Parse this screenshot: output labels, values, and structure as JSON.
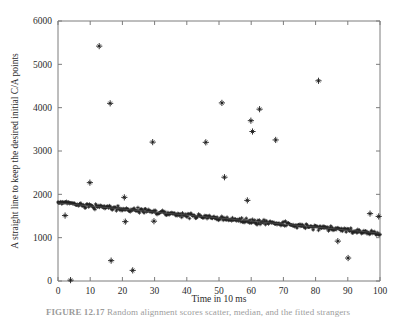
{
  "figure": {
    "caption_label": "FIGURE 12.17",
    "caption_text": "Random alignment scores scatter, median, and the fitted strangers"
  },
  "chart_data": {
    "type": "scatter",
    "title": "",
    "xlabel": "Time  in 10 ms",
    "ylabel": "A straight line to keep the desired initial C/A points",
    "xlim": [
      0,
      100
    ],
    "ylim": [
      0,
      6000
    ],
    "xticks": [
      0,
      10,
      20,
      30,
      40,
      50,
      60,
      70,
      80,
      90,
      100
    ],
    "yticks": [
      0,
      1000,
      2000,
      3000,
      4000,
      5000,
      6000
    ],
    "grid": false,
    "legend": "none",
    "marker": "plus-star",
    "marker_color": "#1a1a1a",
    "series": [
      {
        "name": "outliers",
        "points": [
          [
            2.2,
            1510
          ],
          [
            3.9,
            20
          ],
          [
            9.9,
            2270
          ],
          [
            12.8,
            5420
          ],
          [
            16.2,
            4100
          ],
          [
            16.5,
            470
          ],
          [
            20.6,
            1930
          ],
          [
            20.9,
            1370
          ],
          [
            23.2,
            245
          ],
          [
            29.4,
            3205
          ],
          [
            29.8,
            1380
          ],
          [
            45.9,
            3200
          ],
          [
            50.9,
            4110
          ],
          [
            51.7,
            2395
          ],
          [
            58.8,
            1860
          ],
          [
            59.9,
            3700
          ],
          [
            60.4,
            3450
          ],
          [
            62.6,
            3965
          ],
          [
            67.6,
            3255
          ],
          [
            80.9,
            4620
          ],
          [
            86.9,
            920
          ],
          [
            90.1,
            530
          ],
          [
            96.9,
            1555
          ],
          [
            99.6,
            1490
          ]
        ]
      },
      {
        "name": "dense-band-fit",
        "description": "dense cluster of markers along a descending straight line",
        "line_start": [
          0,
          1800
        ],
        "line_end": [
          100,
          1105
        ],
        "band_halfwidth": 60,
        "n_points": 420
      }
    ]
  }
}
